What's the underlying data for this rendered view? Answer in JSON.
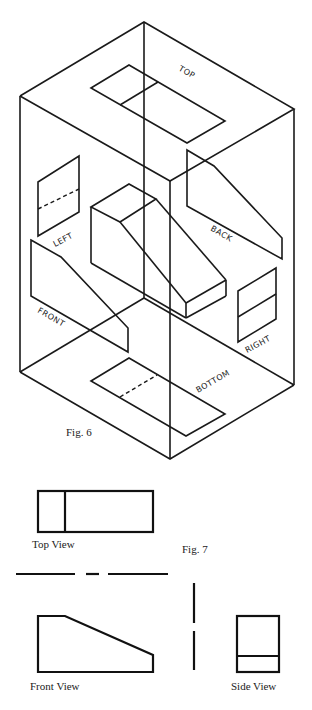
{
  "figure6": {
    "caption": "Fig. 6",
    "description": "Glass box isometric projection of a wedge block onto six planes",
    "planes": [
      {
        "id": "top",
        "label": "TOP"
      },
      {
        "id": "left",
        "label": "LEFT"
      },
      {
        "id": "back",
        "label": "BACK"
      },
      {
        "id": "front",
        "label": "FRONT"
      },
      {
        "id": "right",
        "label": "RIGHT"
      },
      {
        "id": "bottom",
        "label": "BOTTOM"
      }
    ]
  },
  "figure7": {
    "caption": "Fig. 7",
    "views": [
      {
        "id": "top-view",
        "label": "Top View"
      },
      {
        "id": "front-view",
        "label": "Front View"
      },
      {
        "id": "side-view",
        "label": "Side View"
      }
    ]
  },
  "colors": {
    "ink": "#1a1a1a",
    "paper": "#ffffff"
  }
}
